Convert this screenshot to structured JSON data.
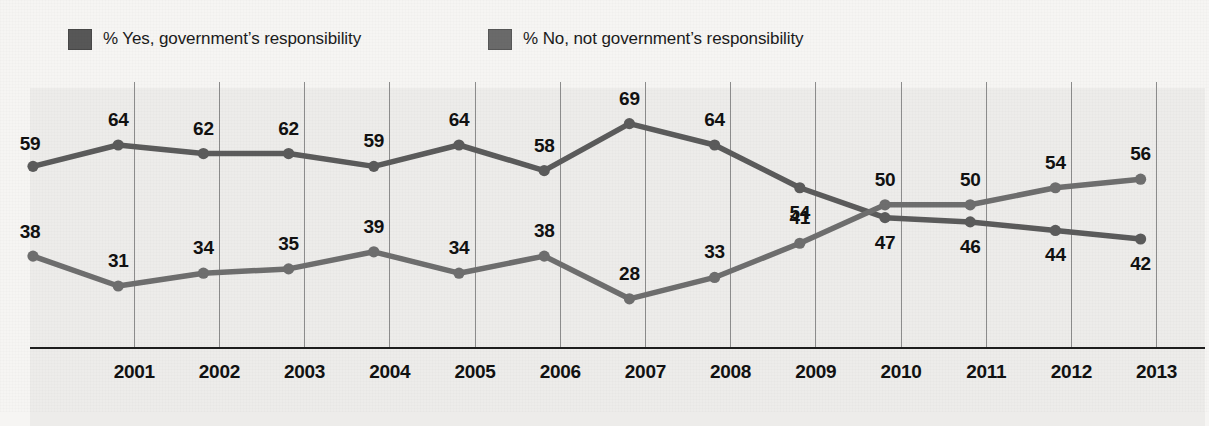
{
  "legend": {
    "items": [
      {
        "key": "yes",
        "label": "% Yes, government’s responsibility",
        "color": "#575757",
        "swatch_name": "legend-swatch-yes"
      },
      {
        "key": "no",
        "label": "% No, not government’s responsibility",
        "color": "#6a6a6a",
        "swatch_name": "legend-swatch-no"
      }
    ]
  },
  "axis": {
    "tick_labels": [
      "2001",
      "2002",
      "2003",
      "2004",
      "2005",
      "2006",
      "2007",
      "2008",
      "2009",
      "2010",
      "2011",
      "2012",
      "2013"
    ]
  },
  "style": {
    "page_background": "#f6f5f3",
    "plot_background": "#edecea",
    "gridline_color": "#8c8c8c",
    "axis_color": "#1e1e1e",
    "label_color": "#111111",
    "series_yes_color": "#5b5b5b",
    "series_no_color": "#6e6e6e"
  },
  "chart_data": {
    "type": "line",
    "title": "",
    "subtitle": "",
    "xlabel": "",
    "ylabel": "",
    "grid": "vertical",
    "legend_position": "top-left",
    "ylim": [
      20,
      75
    ],
    "x": [
      "2000",
      "2001",
      "2002",
      "2003",
      "2004",
      "2005",
      "2006",
      "2007",
      "2008",
      "2009",
      "2010",
      "2011",
      "2012",
      "2013"
    ],
    "xtick_labels": [
      "",
      "2001",
      "2002",
      "2003",
      "2004",
      "2005",
      "2006",
      "2007",
      "2008",
      "2009",
      "2010",
      "2011",
      "2012",
      "2013"
    ],
    "series": [
      {
        "name": "% Yes, government’s responsibility",
        "color": "#5b5b5b",
        "values": [
          59,
          64,
          62,
          62,
          59,
          64,
          58,
          69,
          64,
          54,
          47,
          46,
          44,
          42
        ],
        "label_positions": [
          "above",
          "above",
          "above",
          "above",
          "above",
          "above",
          "above",
          "above",
          "above",
          "below",
          "below",
          "below",
          "below",
          "below"
        ]
      },
      {
        "name": "% No, not government’s responsibility",
        "color": "#6e6e6e",
        "values": [
          38,
          31,
          34,
          35,
          39,
          34,
          38,
          28,
          33,
          41,
          50,
          50,
          54,
          56
        ],
        "label_positions": [
          "above",
          "above",
          "above",
          "above",
          "above",
          "above",
          "above",
          "above",
          "above",
          "above",
          "above",
          "above",
          "above",
          "above"
        ]
      }
    ]
  }
}
